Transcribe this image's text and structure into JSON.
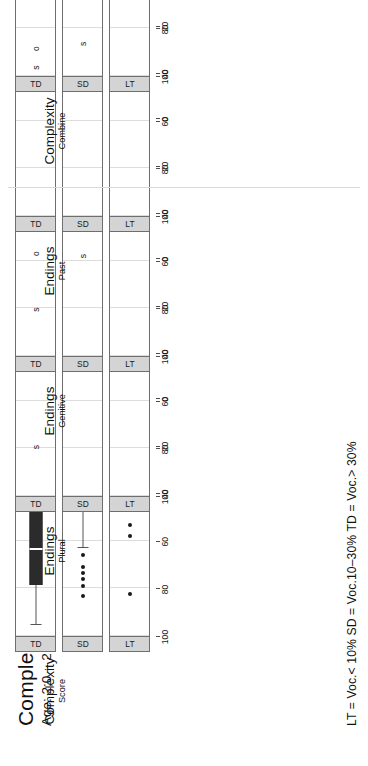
{
  "figure": {
    "title": "Complexity",
    "subtitle": "Age: 2;0 – 2;5",
    "legend": "LT = Voc.< 10%   SD = Voc.10–30%   TD = Voc.> 30%",
    "p_value": "p<0.0001",
    "strip_levels": [
      "LT",
      "SD",
      "TD"
    ],
    "axis_ticks": [
      0,
      20,
      40,
      60,
      80,
      100
    ],
    "axis_tick_labels": [
      "0",
      "20",
      "40",
      "60",
      "80",
      "100"
    ],
    "axis_min": 0,
    "axis_max": 100
  },
  "chart_data": {
    "type": "scatter",
    "title": "Complexity",
    "subtitle": "Age: 2;0 – 2;5",
    "xlabel": "",
    "ylabel": "",
    "xlim": [
      0,
      100
    ],
    "grid": true,
    "legend_note": "LT = Voc.< 10%   SD = Voc.10–30%   TD = Voc.> 30%",
    "marker_legend": {
      "s": "s marker",
      "o": "o marker"
    },
    "panels": [
      {
        "group": "Complexity",
        "sub": "Score",
        "p": "p<0.0001",
        "kind": "box",
        "rows": [
          {
            "strip": "LT",
            "whisker_low": 1.5,
            "q1": 7.5,
            "median": 11.5,
            "q3": 17.5,
            "whisker_high": 27.0,
            "outliers": [
              36.5,
              53.5,
              58.0,
              82.5
            ]
          },
          {
            "strip": "SD",
            "whisker_low": 10.0,
            "q1": 19.5,
            "median": 23.5,
            "q3": 31.0,
            "whisker_high": 63.0,
            "outliers": [
              66.0,
              71.0,
              73.5,
              76.0,
              79.0,
              83.0
            ]
          },
          {
            "strip": "TD",
            "whisker_low": 3.0,
            "q1": 38.0,
            "median": 63.5,
            "q3": 78.5,
            "whisker_high": 95.5,
            "outliers": []
          }
        ]
      },
      {
        "group": "Endings",
        "sub": "Plural",
        "p": "p<0.0001",
        "kind": "marker",
        "rows": [
          {
            "strip": "LT",
            "s": 12.5,
            "o": 1.0
          },
          {
            "strip": "SD",
            "s": 38.5,
            "o": 0.5
          },
          {
            "strip": "TD",
            "s": 79.5,
            "o": 25.5
          }
        ]
      },
      {
        "group": "Endings",
        "sub": "Genitive",
        "p": "p<0.0001",
        "kind": "marker",
        "rows": [
          {
            "strip": "LT",
            "s": 35.5,
            "o": 13.5
          },
          {
            "strip": "SD",
            "s": 58.0,
            "o": 26.5
          },
          {
            "strip": "TD",
            "s": 80.5,
            "o": 57.0
          }
        ]
      },
      {
        "group": "Endings",
        "sub": "Past",
        "p": "p<0.0001",
        "kind": "marker",
        "rows": [
          {
            "strip": "LT",
            "s": 5.0,
            "o": 0.5
          },
          {
            "strip": "SD",
            "s": 5.5,
            "o": 1.0
          },
          {
            "strip": "TD",
            "s": 43.0,
            "o": 14.0
          }
        ]
      },
      {
        "group": "Complexity",
        "sub": "Combine",
        "p": "p<0.0001",
        "kind": "marker",
        "rows": [
          {
            "strip": "LT",
            "s": 57.0,
            "o": 19.5
          },
          {
            "strip": "SD",
            "s": 86.5,
            "o": 51.5
          },
          {
            "strip": "TD",
            "s": 96.5,
            "o": 88.5
          }
        ]
      }
    ]
  }
}
